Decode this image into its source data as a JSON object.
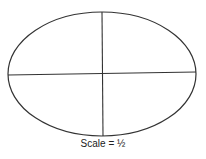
{
  "figure": {
    "shape": "ellipse",
    "ellipse": {
      "cx": 102,
      "cy": 74,
      "rx": 94,
      "ry": 62
    },
    "vertical_axis": {
      "x1": 102,
      "y1": 12,
      "x2": 103,
      "y2": 136
    },
    "horizontal_axis": {
      "x1": 8,
      "y1": 75,
      "x2": 196,
      "y2": 72
    },
    "stroke_color": "#333333"
  },
  "caption": {
    "text": "Scale = ½"
  }
}
